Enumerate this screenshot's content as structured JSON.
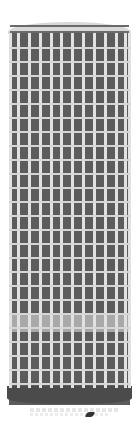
{
  "image": {
    "subject": "skyscraper-illustration",
    "colors": {
      "facade": "#5c5c5c",
      "mullion": "#e2e2e2",
      "floor_line": "#d6d6d6",
      "band": "#a9a9a9",
      "crown": "#d8d8d8",
      "base": "#4b4b4b"
    },
    "columns": 11,
    "floors": 25
  }
}
